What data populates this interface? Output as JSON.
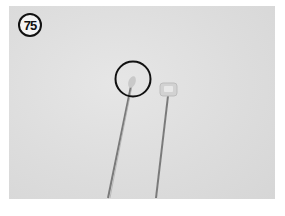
{
  "figure": {
    "step_number": "75",
    "annotation": "circle-highlight",
    "objects": [
      "left-wire-with-tip",
      "right-wire-with-clear-tab"
    ]
  }
}
